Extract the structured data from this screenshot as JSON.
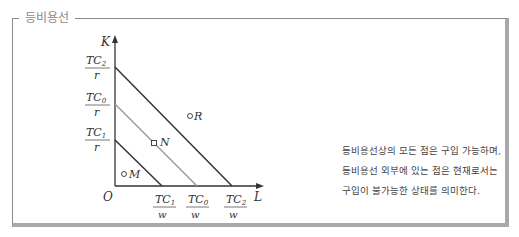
{
  "box": {
    "title": "등비용선"
  },
  "diagram": {
    "axes": {
      "y_label": "K",
      "x_label": "L",
      "origin_label": "O"
    },
    "colors": {
      "dark_line": "#333333",
      "gray_line": "#9a9a9a",
      "frame": "#a8a8a8"
    },
    "y_intercepts": [
      {
        "num": "TC",
        "sub": "2",
        "den": "r"
      },
      {
        "num": "TC",
        "sub": "0",
        "den": "r"
      },
      {
        "num": "TC",
        "sub": "1",
        "den": "r"
      }
    ],
    "x_intercepts": [
      {
        "num": "TC",
        "sub": "1",
        "den": "w"
      },
      {
        "num": "TC",
        "sub": "0",
        "den": "w"
      },
      {
        "num": "TC",
        "sub": "2",
        "den": "w"
      }
    ],
    "points": [
      {
        "label": "R",
        "marker": "circle"
      },
      {
        "label": "N",
        "marker": "square"
      },
      {
        "label": "M",
        "marker": "circle"
      }
    ]
  },
  "description": "등비용선상의 모든 점은 구입 가능하며, 등비용선 외부에 있는 점은 현재로서는 구입이 불가능한 상태를 의미한다."
}
